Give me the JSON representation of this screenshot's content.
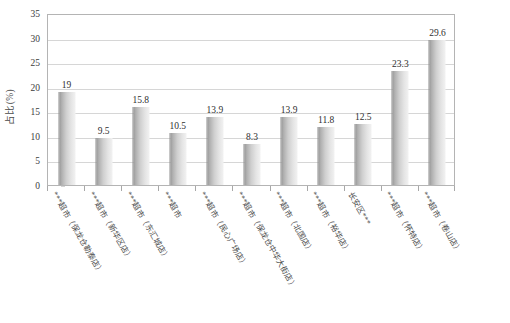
{
  "chart_data": {
    "type": "bar",
    "title": "",
    "subtitle": "",
    "xlabel": "",
    "ylabel": "占比(%)",
    "ylim": [
      0,
      35
    ],
    "ytick_step": 5,
    "yticks": [
      0,
      5,
      10,
      15,
      20,
      25,
      30,
      35
    ],
    "grid": true,
    "legend": false,
    "legend_position": "none",
    "categories": [
      "***超市（保龙仓勒泰店）",
      "***超市（新华区店）",
      "***超市（东汇城店）",
      "***超市",
      "***超市（民心广场店）",
      "***超市（保龙仓中华大街店）",
      "***超市（北国店）",
      "***超市（裕华店）",
      "长安区***",
      "***超市（怀特店）",
      "***超市（卷山店）"
    ],
    "values": [
      19,
      9.5,
      15.8,
      10.5,
      13.9,
      8.3,
      13.9,
      11.8,
      12.5,
      23.3,
      29.6
    ],
    "value_labels": [
      "19",
      "9.5",
      "15.8",
      "10.5",
      "13.9",
      "8.3",
      "13.9",
      "11.8",
      "12.5",
      "23.3",
      "29.6"
    ],
    "series": [
      {
        "name": "占比(%)",
        "values": [
          19,
          9.5,
          15.8,
          10.5,
          13.9,
          8.3,
          13.9,
          11.8,
          12.5,
          23.3,
          29.6
        ]
      }
    ]
  },
  "colors": {
    "bar_dark": "#9a9a9a",
    "bar_light": "#f2f2f2",
    "gridline": "#d6d6d6",
    "axis": "#b4b4b4",
    "text": "#3a3a3a",
    "background": "#ffffff"
  }
}
